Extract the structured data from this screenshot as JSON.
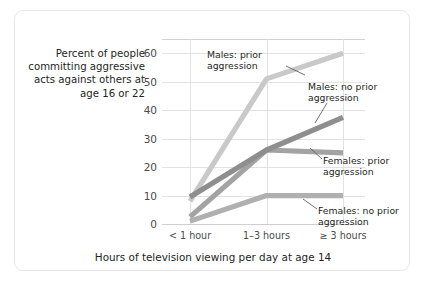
{
  "chart_data": {
    "type": "line",
    "title": "",
    "ylabel": "Percent of people committing aggressive acts against others at age 16 or 22",
    "xlabel": "Hours of television viewing per day at age 14",
    "categories": [
      "< 1 hour",
      "1–3 hours",
      "≥ 3 hours"
    ],
    "ylim": [
      0,
      65
    ],
    "yticks": [
      "0",
      "10",
      "20",
      "30",
      "40",
      "50",
      "60"
    ],
    "ytick_values": [
      0,
      10,
      20,
      30,
      40,
      50,
      60
    ],
    "grid": true,
    "legend": "inline-annotations",
    "series": [
      {
        "name": "Males: prior aggression",
        "label_text": "Males: prior\naggression",
        "values": [
          8,
          51,
          60
        ],
        "color": "#c9c9c9"
      },
      {
        "name": "Males: no prior aggression",
        "label_text": "Males: no prior\naggression",
        "values": [
          9.5,
          26,
          37.5
        ],
        "color": "#8e8e8e"
      },
      {
        "name": "Females: prior aggression",
        "label_text": "Females: prior\naggression",
        "values": [
          2.5,
          26,
          25
        ],
        "color": "#a3a3a3"
      },
      {
        "name": "Females: no prior aggression",
        "label_text": "Females: no prior\naggression",
        "values": [
          1,
          10,
          10
        ],
        "color": "#b0b0b0"
      }
    ]
  },
  "axes": {
    "y_title": "Percent of\npeople committing\naggressive acts\nagainst others at\nage 16 or 22",
    "x_title": "Hours of television viewing per day at age 14"
  }
}
